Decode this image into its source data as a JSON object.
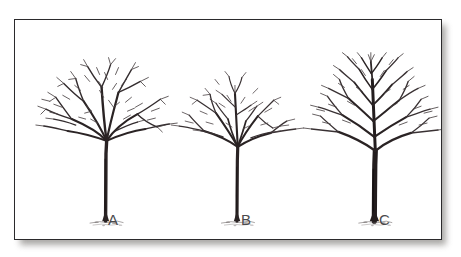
{
  "figure": {
    "kind": "line-illustration",
    "background_color": "#ffffff",
    "frame": {
      "border_color": "#2b2a2c",
      "fill_color": "#ffffff",
      "shadow_color": "#9c9a97"
    },
    "ink_color": "#262122",
    "twig_color": "#4a4244"
  },
  "trees": [
    {
      "id": "tree-a",
      "label": "A",
      "canopy": "dense broad rounded crown, many fine twigs, no central leader",
      "trunk_color": "#2a2324",
      "trunk_width_px": 3,
      "crown_width_px": 128,
      "crown_top_y_px": 58,
      "fork_y_px": 136,
      "base_y_px": 222,
      "center_x_px": 105
    },
    {
      "id": "tree-b",
      "label": "B",
      "canopy": "sparse narrow crown, wide low scaffolds, thin central leader",
      "trunk_color": "#2a2324",
      "trunk_width_px": 3,
      "crown_width_px": 104,
      "crown_top_y_px": 64,
      "fork_y_px": 142,
      "base_y_px": 222,
      "center_x_px": 237
    },
    {
      "id": "tree-c",
      "label": "C",
      "canopy": "tall crown, strong central leader, well spaced scaffold branches",
      "trunk_color": "#231d1e",
      "trunk_width_px": 5,
      "crown_width_px": 134,
      "crown_top_y_px": 40,
      "fork_y_px": 146,
      "base_y_px": 222,
      "center_x_px": 375
    }
  ],
  "labels": {
    "a": "A",
    "b": "B",
    "c": "C"
  }
}
